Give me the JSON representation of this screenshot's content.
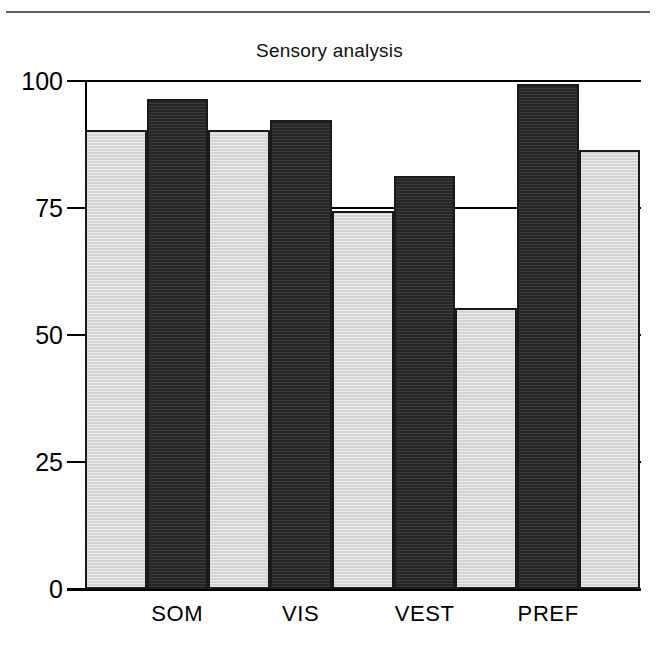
{
  "page": {
    "background_color": "#ffffff",
    "rule_color": "#5d5d5d"
  },
  "chart_data": {
    "type": "bar",
    "title": "Sensory analysis",
    "xlabel": "",
    "ylabel": "",
    "ylim": [
      0,
      100
    ],
    "yticks": [
      "0",
      "25",
      "50",
      "75",
      "100"
    ],
    "ytick_values": [
      0,
      25,
      50,
      75,
      100
    ],
    "grid": true,
    "legend": "none",
    "categories": [
      "SOM",
      "VIS",
      "VEST",
      "PREF"
    ],
    "series": [
      {
        "name": "reference",
        "color": "#d4d4d4",
        "values": [
          90,
          74,
          55,
          86
        ]
      },
      {
        "name": "measured",
        "color": "#262626",
        "values": [
          96,
          92,
          81,
          99
        ]
      }
    ],
    "bars": [
      {
        "index": 0,
        "style": "light",
        "value": 90,
        "x_left_pct": 0.0,
        "width_pct": 11.1
      },
      {
        "index": 1,
        "style": "dark",
        "value": 96,
        "x_left_pct": 11.1,
        "width_pct": 11.1
      },
      {
        "index": 2,
        "style": "light",
        "value": 90,
        "x_left_pct": 22.2,
        "width_pct": 11.1
      },
      {
        "index": 3,
        "style": "light",
        "value": 74,
        "x_left_pct": 33.3,
        "width_pct": 11.1
      },
      {
        "index": 4,
        "style": "dark",
        "value": 92,
        "x_left_pct": 33.3,
        "width_pct": 11.1
      },
      {
        "index": 5,
        "style": "light",
        "value": 74,
        "x_left_pct": 44.4,
        "width_pct": 11.1
      },
      {
        "index": 6,
        "style": "light",
        "value": 55,
        "x_left_pct": 55.5,
        "width_pct": 11.1
      },
      {
        "index": 7,
        "style": "dark",
        "value": 81,
        "x_left_pct": 55.5,
        "width_pct": 11.1
      },
      {
        "index": 8,
        "style": "light",
        "value": 55,
        "x_left_pct": 66.6,
        "width_pct": 11.1
      },
      {
        "index": 9,
        "style": "light",
        "value": 86,
        "x_left_pct": 77.7,
        "width_pct": 11.1
      },
      {
        "index": 10,
        "style": "dark",
        "value": 99,
        "x_left_pct": 77.7,
        "width_pct": 11.1
      },
      {
        "index": 11,
        "style": "light",
        "value": 86,
        "x_left_pct": 88.8,
        "width_pct": 11.1
      }
    ],
    "category_centers_pct": [
      16.6,
      38.8,
      61.1,
      83.3
    ]
  }
}
